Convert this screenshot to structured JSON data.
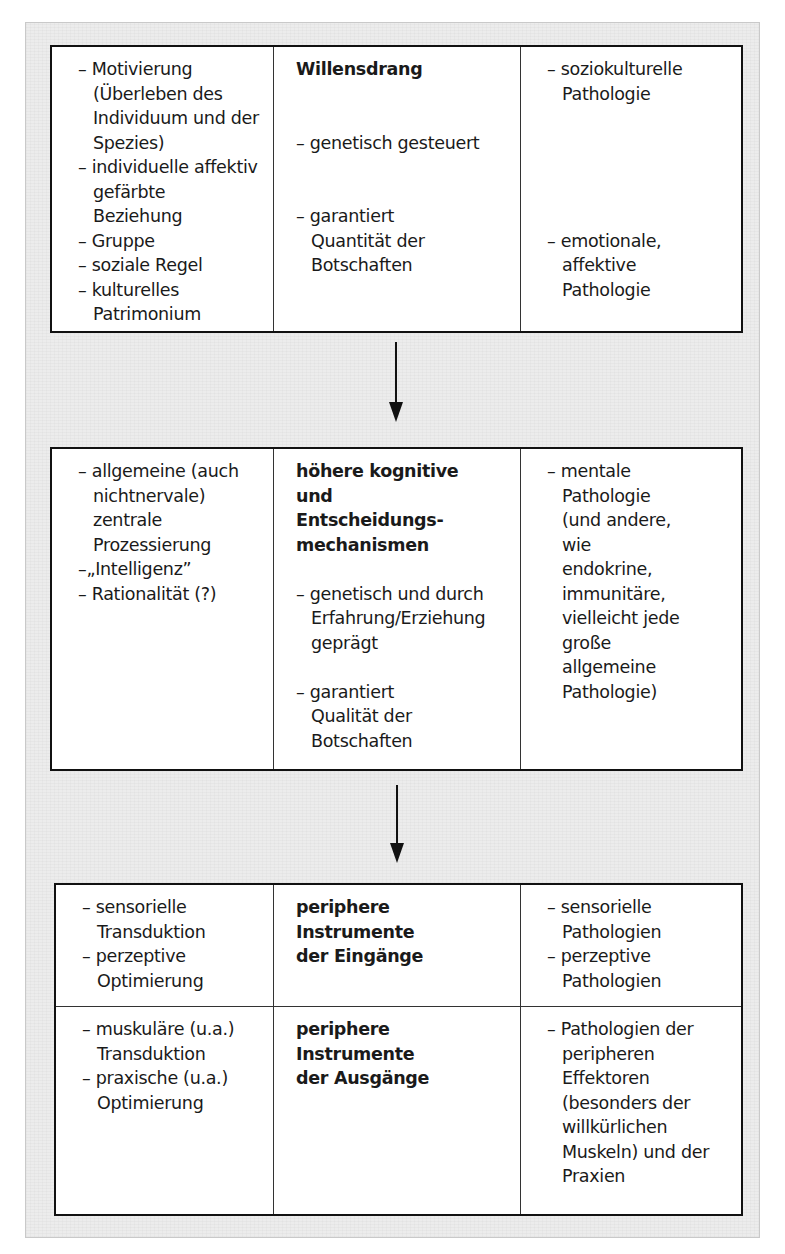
{
  "boxes": [
    {
      "left": [
        "– Motivierung (Überleben des Individuum und der Spezies)",
        "– individuelle affektiv gefärbte Beziehung",
        "– Gruppe",
        "– soziale Regel",
        "– kulturelles Patrimonium"
      ],
      "title": "Willensdrang",
      "middle": [
        "– genetisch gesteuert",
        "– garantiert Quantität der Botschaften"
      ],
      "right": [
        "– soziokulturelle Pathologie",
        "– emotionale, affektive Pathologie"
      ]
    },
    {
      "left": [
        "– allgemeine (auch nichtnervale) zentrale Prozessierung",
        "–„Intelligenz”",
        "– Rationalität (?)"
      ],
      "title_lines": [
        "höhere kognitive",
        "und",
        "Entscheidungs-",
        "mechanismen"
      ],
      "middle": [
        "– genetisch und durch Erfahrung/Erziehung geprägt",
        "– garantiert Qualität der Botschaften"
      ],
      "right": [
        "– mentale Pathologie (und andere, wie endokrine, immunitäre, vielleicht jede große allgemeine Pathologie)"
      ]
    },
    {
      "inputs": {
        "left": [
          "– sensorielle Transduktion",
          "– perzeptive Optimierung"
        ],
        "title_lines": [
          "periphere",
          "Instrumente",
          "der Eingänge"
        ],
        "right": [
          "– sensorielle Pathologien",
          "– perzeptive Pathologien"
        ]
      },
      "outputs": {
        "left": [
          "– muskuläre (u.a.) Transduktion",
          "– praxische (u.a.) Optimierung"
        ],
        "title_lines": [
          "periphere",
          "Instrumente",
          "der Ausgänge"
        ],
        "right": [
          "– Pathologien der peripheren Effektoren (besonders der willkürlichen Muskeln) und der Praxien"
        ]
      }
    }
  ],
  "arrows": [
    {
      "from": "Willensdrang",
      "to": "höhere kognitive und Entscheidungsmechanismen",
      "direction": "down"
    },
    {
      "from": "höhere kognitive und Entscheidungsmechanismen",
      "to": "periphere Instrumente",
      "direction": "down"
    }
  ]
}
